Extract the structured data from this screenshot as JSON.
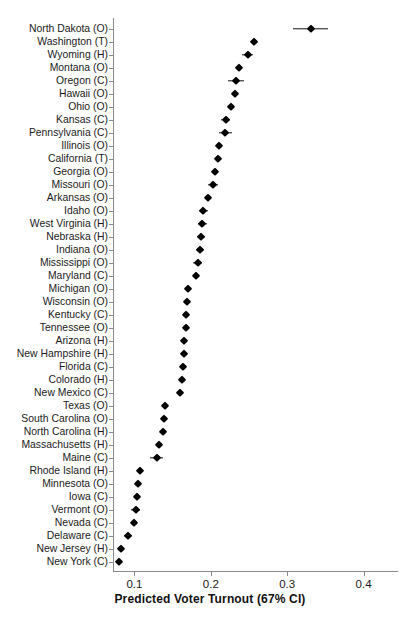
{
  "chart_data": {
    "type": "scatter",
    "title": "",
    "xlabel": "Predicted Voter Turnout (67% CI)",
    "ylabel": "",
    "xlim": [
      0.072,
      0.445
    ],
    "xticks": [
      0.1,
      0.2,
      0.3,
      0.4
    ],
    "xticklabels": [
      "0.1",
      "0.2",
      "0.3",
      "0.4"
    ],
    "grid": false,
    "legend": null,
    "orientation": "horizontal-dotplot",
    "error_bars": "67% CI",
    "categories": [
      "North Dakota (O)",
      "Washington (T)",
      "Wyoming (H)",
      "Montana (O)",
      "Oregon (C)",
      "Hawaii (O)",
      "Ohio (O)",
      "Kansas (C)",
      "Pennsylvania (C)",
      "Illinois (O)",
      "California (T)",
      "Georgia (O)",
      "Missouri (O)",
      "Arkansas (O)",
      "Idaho (O)",
      "West Virginia (H)",
      "Nebraska (H)",
      "Indiana (O)",
      "Mississippi (O)",
      "Maryland (C)",
      "Michigan (O)",
      "Wisconsin (O)",
      "Kentucky (C)",
      "Tennessee (O)",
      "Arizona (H)",
      "New Hampshire (H)",
      "Florida (C)",
      "Colorado (H)",
      "New Mexico (C)",
      "Texas (O)",
      "South Carolina (O)",
      "North Carolina (H)",
      "Massachusetts (H)",
      "Maine (C)",
      "Rhode Island (H)",
      "Minnesota (O)",
      "Iowa (C)",
      "Vermont (O)",
      "Nevada (C)",
      "Delaware (C)",
      "New Jersey (H)",
      "New York (C)"
    ],
    "values": [
      0.3305,
      0.2565,
      0.2483,
      0.2366,
      0.233,
      0.2313,
      0.2263,
      0.2195,
      0.2192,
      0.2107,
      0.209,
      0.2058,
      0.2028,
      0.1958,
      0.1903,
      0.1888,
      0.1872,
      0.1855,
      0.1826,
      0.18,
      0.1695,
      0.169,
      0.168,
      0.167,
      0.1652,
      0.1645,
      0.1635,
      0.1628,
      0.16,
      0.1405,
      0.1392,
      0.138,
      0.132,
      0.129,
      0.1075,
      0.105,
      0.1038,
      0.1015,
      0.099,
      0.0915,
      0.082,
      0.0805
    ],
    "ci_low": [
      0.307,
      0.2565,
      0.2413,
      0.2366,
      0.222,
      0.2313,
      0.2263,
      0.2138,
      0.2112,
      0.2107,
      0.209,
      0.2058,
      0.1968,
      0.1958,
      0.184,
      0.183,
      0.182,
      0.18,
      0.177,
      0.18,
      0.1695,
      0.1655,
      0.165,
      0.167,
      0.162,
      0.161,
      0.16,
      0.1595,
      0.156,
      0.1365,
      0.1392,
      0.138,
      0.1285,
      0.12,
      0.1075,
      0.105,
      0.1038,
      0.096,
      0.099,
      0.086,
      0.082,
      0.0805
    ],
    "ci_high": [
      0.354,
      0.2565,
      0.2553,
      0.2366,
      0.244,
      0.2313,
      0.2263,
      0.2252,
      0.2272,
      0.2107,
      0.209,
      0.2058,
      0.2088,
      0.1958,
      0.1966,
      0.1946,
      0.1924,
      0.191,
      0.1882,
      0.18,
      0.1695,
      0.1725,
      0.171,
      0.167,
      0.1684,
      0.168,
      0.167,
      0.1661,
      0.164,
      0.1445,
      0.1392,
      0.138,
      0.1355,
      0.138,
      0.1075,
      0.105,
      0.1038,
      0.107,
      0.099,
      0.097,
      0.082,
      0.0805
    ]
  },
  "axis": {
    "x_title": "Predicted Voter Turnout (67% CI)"
  },
  "colors": {
    "marker": "#000000",
    "axis": "#8a8a8a",
    "text": "#1a1a1a",
    "background": "#ffffff"
  }
}
